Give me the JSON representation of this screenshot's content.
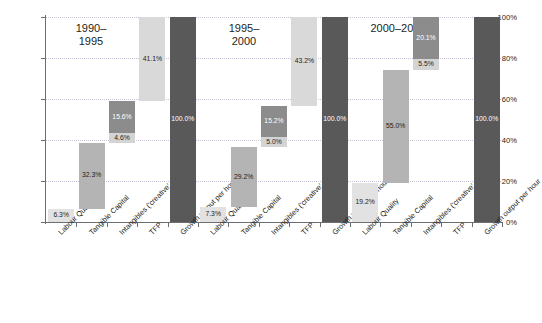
{
  "chart_data": {
    "type": "bar",
    "title": "",
    "subtitle": "",
    "xlabel": "",
    "ylabel": "",
    "ylim": [
      0,
      100
    ],
    "grid": true,
    "legend_position": "none",
    "y_ticks": [
      "0%",
      "20%",
      "40%",
      "60%",
      "80%",
      "100%"
    ],
    "y_tick_values": [
      0,
      20,
      40,
      60,
      80,
      100
    ],
    "categories": [
      "Labour Quality",
      "Tangible Capital",
      "Intangibles ('creative' & 'other')",
      "TFP",
      "Growth output per hour"
    ],
    "panels": [
      {
        "title": "1990–\n1995",
        "values": [
          6.3,
          32.3,
          15.6,
          41.1,
          100.0
        ],
        "labels": [
          "6.3%",
          "32.3%",
          "15.6%",
          "41.1%",
          "100.0%"
        ],
        "extra_label": "4.6%",
        "extra_value": 4.6
      },
      {
        "title": "1995–\n2000",
        "values": [
          7.3,
          29.2,
          15.2,
          43.2,
          100.0
        ],
        "labels": [
          "7.3%",
          "29.2%",
          "15.2%",
          "43.2%",
          "100.0%"
        ],
        "extra_label": "5.0%",
        "extra_value": 5.0
      },
      {
        "title": "2000–2009",
        "values": [
          19.2,
          55.0,
          20.1,
          0.0,
          100.0
        ],
        "labels": [
          "19.2%",
          "55.0%",
          "20.1%",
          "",
          "100.0%"
        ],
        "extra_label": "5.5%",
        "extra_value": 5.5
      }
    ],
    "colors": {
      "labour_quality": "#e2e2e2",
      "tangible_capital": "#b4b4b4",
      "intangibles_other": "#8c8c8c",
      "intangibles_creative": "#d4d4d4",
      "tfp": "#d9d9d9",
      "total": "#595959",
      "gridline": "#c8c3d8",
      "axis": "#6d6e71",
      "text": "#231f20"
    }
  }
}
